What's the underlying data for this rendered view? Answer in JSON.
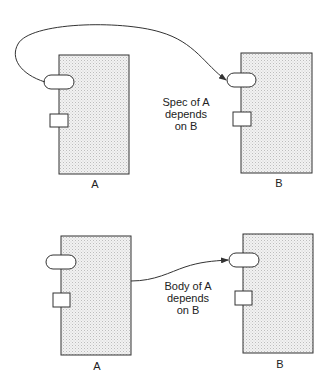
{
  "diagram": {
    "colors": {
      "stroke": "#333333",
      "fill_dot": "#bdbdbd",
      "background": "#ffffff"
    },
    "panels": [
      {
        "id": "spec-dependency",
        "left_unit": {
          "label": "A"
        },
        "right_unit": {
          "label": "B"
        },
        "arrow_from": "A specification (oval)",
        "arrow_to": "B specification (oval)",
        "caption": [
          "Spec of A",
          "depends",
          "on B"
        ]
      },
      {
        "id": "body-dependency",
        "left_unit": {
          "label": "A"
        },
        "right_unit": {
          "label": "B"
        },
        "arrow_from": "A body (box)",
        "arrow_to": "B specification (oval)",
        "caption": [
          "Body of A",
          "depends",
          "on B"
        ]
      }
    ]
  }
}
